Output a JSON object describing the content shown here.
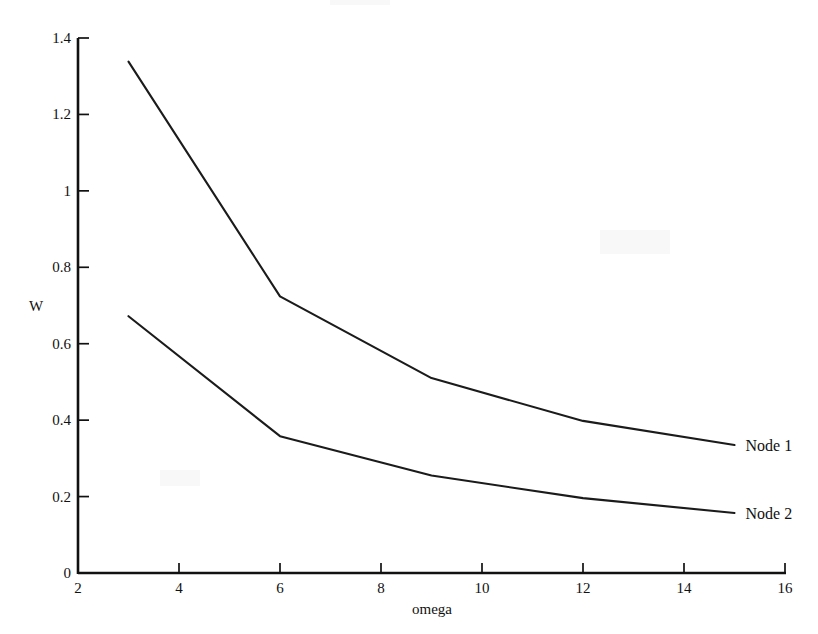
{
  "figure": {
    "width": 818,
    "height": 634,
    "background_color": "#ffffff",
    "ink_color": "#111111"
  },
  "chart_data": {
    "type": "line",
    "title": "",
    "subtitle": "",
    "xlabel": "omega",
    "ylabel": "W",
    "xlim": [
      2,
      16
    ],
    "ylim": [
      0,
      1.4
    ],
    "xticks": [
      2,
      4,
      6,
      8,
      10,
      12,
      14,
      16
    ],
    "xtick_labels": [
      "2",
      "4",
      "6",
      "8",
      "10",
      "12",
      "14",
      "16"
    ],
    "yticks": [
      0,
      0.2,
      0.4,
      0.6,
      0.8,
      1,
      1.2,
      1.4
    ],
    "ytick_labels": [
      "0",
      "0.2",
      "0.4",
      "0.6",
      "0.8",
      "1",
      "1.2",
      "1.4"
    ],
    "grid": false,
    "legend_position": "right-of-line-ends",
    "x": [
      3,
      6,
      9,
      12,
      15
    ],
    "series": [
      {
        "name": "Node 1",
        "label": "Node 1",
        "color": "#1b1b1b",
        "values": [
          1.338,
          0.724,
          0.51,
          0.398,
          0.335
        ]
      },
      {
        "name": "Node 2",
        "label": "Node 2",
        "color": "#1b1b1b",
        "values": [
          0.672,
          0.358,
          0.255,
          0.196,
          0.157
        ]
      }
    ]
  }
}
